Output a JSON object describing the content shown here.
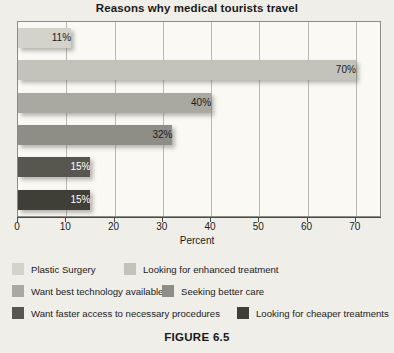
{
  "figure": {
    "caption": "FIGURE 6.5"
  },
  "chart_data": {
    "type": "bar",
    "orientation": "horizontal",
    "title": "Reasons why medical tourists travel",
    "xlabel": "Percent",
    "ylabel": "",
    "xlim": [
      0,
      75
    ],
    "xticks": [
      "0",
      "10",
      "20",
      "30",
      "40",
      "50",
      "60",
      "70"
    ],
    "xtick_values": [
      0,
      10,
      20,
      30,
      40,
      50,
      60,
      70
    ],
    "grid": true,
    "legend_position": "bottom",
    "categories": [
      "Plastic Surgery",
      "Looking for enhanced treatment",
      "Want best technology available",
      "Seeking better care",
      "Want faster access to necessary procedures",
      "Looking for cheaper treatments"
    ],
    "values": [
      11,
      70,
      40,
      32,
      15,
      15
    ],
    "data_labels": [
      "11%",
      "70%",
      "40%",
      "32%",
      "15%",
      "15%"
    ],
    "colors": [
      "#d3d2cb",
      "#c3c2bb",
      "#a9a8a1",
      "#8e8d86",
      "#58574f",
      "#3f3e37"
    ],
    "label_text_colors": [
      "dark",
      "dark",
      "dark",
      "dark",
      "light",
      "light"
    ]
  },
  "legend": {
    "items": [
      {
        "label": "Plastic Surgery",
        "color": "#d3d2cb"
      },
      {
        "label": "Looking for enhanced treatment",
        "color": "#c3c2bb"
      },
      {
        "label": "Want best technology available",
        "color": "#a9a8a1"
      },
      {
        "label": "Seeking better care",
        "color": "#8e8d86"
      },
      {
        "label": "Want faster access to necessary procedures",
        "color": "#58574f"
      },
      {
        "label": "Looking for cheaper treatments",
        "color": "#3f3e37"
      }
    ]
  }
}
